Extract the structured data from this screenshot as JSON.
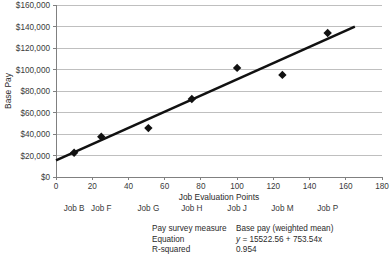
{
  "chart_data": {
    "type": "scatter",
    "title": "",
    "xlabel": "Job Evaluation Points",
    "ylabel": "Base Pay",
    "xlim": [
      0,
      180
    ],
    "ylim": [
      0,
      160000
    ],
    "xticks": [
      0,
      20,
      40,
      60,
      80,
      100,
      120,
      140,
      160,
      180
    ],
    "xtick_labels": [
      "0",
      "20",
      "40",
      "60",
      "80",
      "100",
      "120",
      "140",
      "160",
      "180"
    ],
    "yticks": [
      0,
      20000,
      40000,
      60000,
      80000,
      100000,
      120000,
      140000,
      160000
    ],
    "ytick_labels": [
      "$0",
      "$20,000",
      "$40,000",
      "$60,000",
      "$80,000",
      "$100,000",
      "$120,000",
      "$140,000",
      "$160,000"
    ],
    "grid": "horizontal",
    "legend": "none",
    "point_labels": [
      "Job B",
      "Job F",
      "Job G",
      "Job H",
      "Job J",
      "Job M",
      "Job P"
    ],
    "points": [
      {
        "label": "Job B",
        "x": 10,
        "y": 22500
      },
      {
        "label": "Job F",
        "x": 25,
        "y": 37500
      },
      {
        "label": "Job G",
        "x": 51,
        "y": 45500
      },
      {
        "label": "Job H",
        "x": 75,
        "y": 72500
      },
      {
        "label": "Job J",
        "x": 100,
        "y": 101500
      },
      {
        "label": "Job M",
        "x": 125,
        "y": 95000
      },
      {
        "label": "Job P",
        "x": 150,
        "y": 134000
      }
    ],
    "trendline": {
      "intercept": 15522.56,
      "slope": 753.54,
      "x_start": 0,
      "x_end": 165
    }
  },
  "stats": {
    "rows": [
      {
        "key": "Pay survey measure",
        "value": "Base pay (weighted mean)",
        "italic_prefix": ""
      },
      {
        "key": "Equation",
        "value": "= 15522.56 +  753.54x",
        "italic_prefix": "y "
      },
      {
        "key": "R-squared",
        "value": "0.954",
        "italic_prefix": ""
      }
    ]
  },
  "colors": {
    "marker": "#111111",
    "trendline": "#111111",
    "gridline": "#bfbfbf",
    "axis": "#808080",
    "text": "#333333",
    "background": "#ffffff"
  }
}
